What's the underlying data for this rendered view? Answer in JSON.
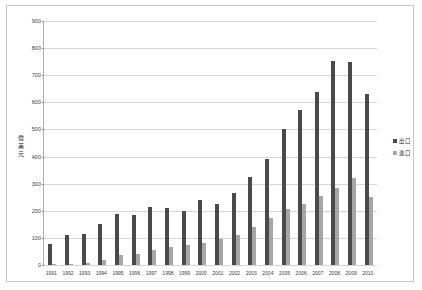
{
  "chart_data": {
    "type": "bar",
    "title": "",
    "xlabel": "",
    "ylabel": "億美元",
    "ylabel_chars": [
      "億",
      "美",
      "元"
    ],
    "ylim": [
      0,
      900
    ],
    "ytick_step": 100,
    "yticks": [
      0,
      100,
      200,
      300,
      400,
      500,
      600,
      700,
      800,
      900
    ],
    "grid": true,
    "legend_position": "right",
    "categories": [
      "1991",
      "1992",
      "1993",
      "1994",
      "1995",
      "1996",
      "1997",
      "1998",
      "1999",
      "2000",
      "2001",
      "2002",
      "2003",
      "2004",
      "2005",
      "2006",
      "2007",
      "2008",
      "2009",
      "2010"
    ],
    "series": [
      {
        "name": "出口",
        "color": "#4a4a4a",
        "values": [
          78,
          110,
          115,
          150,
          190,
          185,
          215,
          210,
          200,
          240,
          225,
          265,
          325,
          390,
          500,
          570,
          640,
          752,
          748,
          630
        ]
      },
      {
        "name": "進口",
        "color": "#a6a6a6",
        "values": [
          2,
          3,
          6,
          18,
          38,
          40,
          55,
          68,
          72,
          80,
          95,
          110,
          140,
          175,
          205,
          225,
          255,
          285,
          320,
          250
        ]
      }
    ]
  },
  "chart": {
    "ytick_labels": [
      "900",
      "800",
      "700",
      "600",
      "500",
      "400",
      "300",
      "200",
      "100",
      "0"
    ],
    "legend": [
      {
        "label": "出口",
        "swatch": "export"
      },
      {
        "label": "進口",
        "swatch": "import"
      }
    ]
  }
}
